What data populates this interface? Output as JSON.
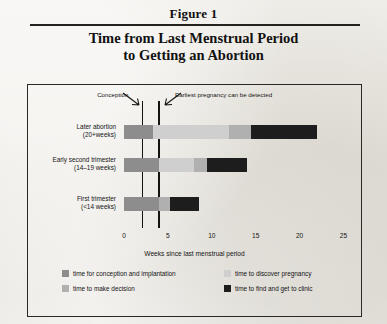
{
  "figure": {
    "label": "Figure 1",
    "title_line1": "Time from Last Menstrual Period",
    "title_line2": "to Getting an Abortion"
  },
  "annotations": [
    {
      "name": "conception",
      "text": "Conception",
      "week": 2.1
    },
    {
      "name": "earliest-detection",
      "text": "Earliest pregnancy can be detected",
      "week": 4.0
    }
  ],
  "colors": {
    "conception_implantation": "#8d8d8d",
    "discover_pregnancy": "#cfcfcf",
    "make_decision": "#b0b0b0",
    "find_get_to_clinic": "#1d1d1d",
    "frame": "#2a2724",
    "axis": "#15130f",
    "paper": "#eceae5"
  },
  "legend": {
    "items": [
      {
        "name": "time for conception and implantation",
        "label": "time for conception and implantation",
        "color": "#8d8d8d"
      },
      {
        "name": "time to make decision",
        "label": "time to make decision",
        "color": "#b0b0b0"
      },
      {
        "name": "time to discover pregnancy",
        "label": "time to discover pregnancy",
        "color": "#cfcfcf"
      },
      {
        "name": "time to find and get to clinic",
        "label": "time to find and get to clinic",
        "color": "#1d1d1d"
      }
    ]
  },
  "chart_data": {
    "type": "bar",
    "orientation": "horizontal",
    "stacked": true,
    "title": "Time from Last Menstrual Period to Getting an Abortion",
    "xlabel": "Weeks since last menstrual period",
    "ylabel": "",
    "xlim": [
      0,
      26.5
    ],
    "xticks": [
      0,
      5,
      10,
      15,
      20,
      25
    ],
    "xtick_labels": [
      "0",
      "5",
      "10",
      "15",
      "20",
      "25"
    ],
    "grid": false,
    "legend_position": "bottom",
    "categories": [
      {
        "label_line1": "Later abortion",
        "label_line2": "(20+weeks)"
      },
      {
        "label_line1": "Early second trimester",
        "label_line2": "(14–19 weeks)"
      },
      {
        "label_line1": "First trimester",
        "label_line2": "(<14 weeks)"
      }
    ],
    "series": [
      {
        "name": "time for conception and implantation",
        "color": "#8d8d8d",
        "values": [
          3.3,
          4.0,
          4.0
        ]
      },
      {
        "name": "time to discover pregnancy",
        "color": "#cfcfcf",
        "values": [
          8.7,
          4.0,
          0.0
        ]
      },
      {
        "name": "time to make decision",
        "color": "#b0b0b0",
        "values": [
          2.5,
          1.5,
          1.2
        ]
      },
      {
        "name": "time to find and get to clinic",
        "color": "#1d1d1d",
        "values": [
          7.5,
          4.5,
          3.3
        ]
      }
    ],
    "totals": [
      22.0,
      14.0,
      8.5
    ]
  }
}
